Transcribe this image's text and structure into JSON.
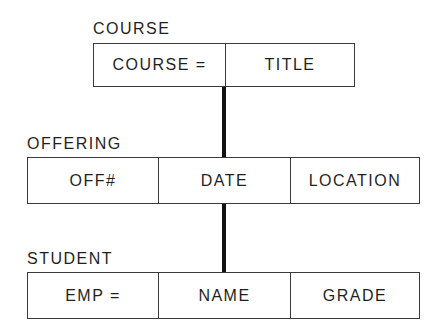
{
  "diagram": {
    "type": "hierarchical-record-structure",
    "segments": [
      {
        "name": "COURSE",
        "fields": [
          "COURSE =",
          "TITLE"
        ]
      },
      {
        "name": "OFFERING",
        "fields": [
          "OFF#",
          "DATE",
          "LOCATION"
        ]
      },
      {
        "name": "STUDENT",
        "fields": [
          "EMP =",
          "NAME",
          "GRADE"
        ]
      }
    ],
    "links": [
      {
        "parent": "COURSE",
        "child": "OFFERING"
      },
      {
        "parent": "OFFERING",
        "child": "STUDENT"
      }
    ],
    "colors": {
      "line": "#111111",
      "text": "#1f1f1f",
      "border": "#3a3a3a"
    }
  }
}
